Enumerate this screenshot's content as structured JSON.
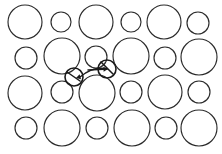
{
  "figure": {
    "width": 222,
    "height": 154,
    "background_color": "#ffffff",
    "stroke_color": "#2b2b2b",
    "highlight_color": "#1a1a1a"
  },
  "chart_data": {
    "type": "scatter",
    "xlabel": "",
    "ylabel": "",
    "xlim": [
      0,
      222
    ],
    "ylim": [
      0,
      154
    ],
    "grid": false,
    "legend": "none",
    "units": "pixels",
    "series": [
      {
        "name": "detected circles",
        "marker": "ring",
        "fields": [
          "cx",
          "cy",
          "r",
          "size_class",
          "row",
          "col"
        ],
        "points": [
          {
            "cx": 25,
            "cy": 22,
            "r": 17,
            "size_class": "large",
            "row": 1,
            "col": 1
          },
          {
            "cx": 61,
            "cy": 22,
            "r": 10,
            "size_class": "small",
            "row": 1,
            "col": 2
          },
          {
            "cx": 96,
            "cy": 22,
            "r": 17,
            "size_class": "large",
            "row": 1,
            "col": 3
          },
          {
            "cx": 131,
            "cy": 22,
            "r": 10,
            "size_class": "small",
            "row": 1,
            "col": 4
          },
          {
            "cx": 164,
            "cy": 22,
            "r": 17,
            "size_class": "large",
            "row": 1,
            "col": 5
          },
          {
            "cx": 198,
            "cy": 23,
            "r": 11,
            "size_class": "small",
            "row": 1,
            "col": 6
          },
          {
            "cx": 26,
            "cy": 58,
            "r": 11,
            "size_class": "small",
            "row": 2,
            "col": 1
          },
          {
            "cx": 62,
            "cy": 56,
            "r": 18,
            "size_class": "large",
            "row": 2,
            "col": 2
          },
          {
            "cx": 96,
            "cy": 57,
            "r": 11,
            "size_class": "small",
            "row": 2,
            "col": 3
          },
          {
            "cx": 131,
            "cy": 56,
            "r": 18,
            "size_class": "large",
            "row": 2,
            "col": 4
          },
          {
            "cx": 165,
            "cy": 58,
            "r": 11,
            "size_class": "small",
            "row": 2,
            "col": 5
          },
          {
            "cx": 199,
            "cy": 57,
            "r": 18,
            "size_class": "large",
            "row": 2,
            "col": 6
          },
          {
            "cx": 25,
            "cy": 93,
            "r": 17,
            "size_class": "large",
            "row": 3,
            "col": 1
          },
          {
            "cx": 62,
            "cy": 92,
            "r": 11,
            "size_class": "small",
            "row": 3,
            "col": 2
          },
          {
            "cx": 97,
            "cy": 93,
            "r": 18,
            "size_class": "large",
            "row": 3,
            "col": 3
          },
          {
            "cx": 131,
            "cy": 92,
            "r": 11,
            "size_class": "small",
            "row": 3,
            "col": 4
          },
          {
            "cx": 165,
            "cy": 92,
            "r": 17,
            "size_class": "large",
            "row": 3,
            "col": 5
          },
          {
            "cx": 199,
            "cy": 92,
            "r": 11,
            "size_class": "small",
            "row": 3,
            "col": 6
          },
          {
            "cx": 26,
            "cy": 128,
            "r": 11,
            "size_class": "small",
            "row": 4,
            "col": 1
          },
          {
            "cx": 62,
            "cy": 128,
            "r": 18,
            "size_class": "large",
            "row": 4,
            "col": 2
          },
          {
            "cx": 97,
            "cy": 128,
            "r": 11,
            "size_class": "small",
            "row": 4,
            "col": 3
          },
          {
            "cx": 132,
            "cy": 128,
            "r": 18,
            "size_class": "large",
            "row": 4,
            "col": 4
          },
          {
            "cx": 166,
            "cy": 128,
            "r": 11,
            "size_class": "small",
            "row": 4,
            "col": 5
          },
          {
            "cx": 199,
            "cy": 128,
            "r": 18,
            "size_class": "large",
            "row": 4,
            "col": 6
          }
        ]
      },
      {
        "name": "marked circles",
        "marker": "ring-highlighted",
        "fields": [
          "cx",
          "cy",
          "r"
        ],
        "points": [
          {
            "cx": 74,
            "cy": 77,
            "r": 9
          },
          {
            "cx": 107,
            "cy": 69,
            "r": 9
          }
        ]
      }
    ],
    "annotations": [
      {
        "id": "arrow-left",
        "type": "arrow",
        "target_cx": 74,
        "target_cy": 77,
        "from_x": 107,
        "from_y": 69,
        "to_x": 76,
        "to_y": 78,
        "curved": true
      },
      {
        "id": "arrow-right",
        "type": "arrow",
        "target_cx": 107,
        "target_cy": 69,
        "from_x": 88,
        "from_y": 70,
        "to_x": 108,
        "to_y": 69,
        "curved": false
      },
      {
        "id": "tick-left",
        "type": "tick",
        "from_x": 67,
        "from_y": 72,
        "to_x": 80,
        "to_y": 81
      },
      {
        "id": "tick-right",
        "type": "tick",
        "from_x": 101,
        "from_y": 62,
        "to_x": 113,
        "to_y": 74
      }
    ]
  }
}
